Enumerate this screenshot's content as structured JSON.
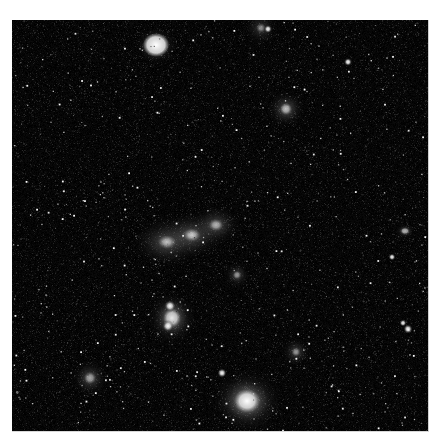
{
  "image": {
    "description": "Deep-sky astronomical image of a galaxy group in grayscale",
    "frame": {
      "x": 12,
      "y": 20,
      "width": 416,
      "height": 411,
      "background": "#030303",
      "page_background": "#ffffff"
    }
  },
  "galaxies": [
    {
      "name": "bright-star-top-left",
      "x": 144,
      "y": 25,
      "core": 9,
      "halo": 22,
      "rx": 1.0,
      "ry": 0.9,
      "brightness": 1.0
    },
    {
      "name": "galaxy-top-right",
      "x": 274,
      "y": 89,
      "core": 3,
      "halo": 20,
      "rx": 1.0,
      "ry": 1.0,
      "brightness": 0.75
    },
    {
      "name": "galaxy-top-edge",
      "x": 249,
      "y": 8,
      "core": 2,
      "halo": 18,
      "rx": 1.0,
      "ry": 1.0,
      "brightness": 0.55
    },
    {
      "name": "galaxy-group-left",
      "x": 155,
      "y": 222,
      "core": 3,
      "halo": 30,
      "rx": 1.2,
      "ry": 0.9,
      "brightness": 0.8
    },
    {
      "name": "galaxy-group-center",
      "x": 180,
      "y": 215,
      "core": 3,
      "halo": 28,
      "rx": 1.2,
      "ry": 0.9,
      "brightness": 0.8
    },
    {
      "name": "galaxy-group-right",
      "x": 204,
      "y": 205,
      "core": 3,
      "halo": 24,
      "rx": 1.1,
      "ry": 0.9,
      "brightness": 0.7
    },
    {
      "name": "galaxy-mid-small",
      "x": 225,
      "y": 255,
      "core": 2,
      "halo": 14,
      "rx": 1.0,
      "ry": 1.0,
      "brightness": 0.6
    },
    {
      "name": "galaxy-pair-lower-left",
      "x": 160,
      "y": 298,
      "core": 5,
      "halo": 26,
      "rx": 1.0,
      "ry": 1.1,
      "brightness": 0.9
    },
    {
      "name": "galaxy-lower-right",
      "x": 284,
      "y": 332,
      "core": 2,
      "halo": 16,
      "rx": 1.0,
      "ry": 1.0,
      "brightness": 0.6
    },
    {
      "name": "galaxy-bottom-left",
      "x": 78,
      "y": 358,
      "core": 3,
      "halo": 20,
      "rx": 1.0,
      "ry": 1.0,
      "brightness": 0.65
    },
    {
      "name": "bright-galaxy-bottom",
      "x": 235,
      "y": 381,
      "core": 7,
      "halo": 34,
      "rx": 1.1,
      "ry": 1.0,
      "brightness": 1.0
    },
    {
      "name": "double-star-right",
      "x": 393,
      "y": 211,
      "core": 2,
      "halo": 8,
      "rx": 1.3,
      "ry": 1.0,
      "brightness": 0.7
    }
  ],
  "stars": {
    "count": 1400,
    "seed": 42,
    "min_brightness": 40,
    "max_brightness": 255
  },
  "notable_stars": [
    {
      "x": 158,
      "y": 286,
      "r": 2.0
    },
    {
      "x": 156,
      "y": 306,
      "r": 2.0
    },
    {
      "x": 210,
      "y": 353,
      "r": 1.6
    },
    {
      "x": 396,
      "y": 309,
      "r": 1.6
    },
    {
      "x": 391,
      "y": 303,
      "r": 1.2
    },
    {
      "x": 336,
      "y": 42,
      "r": 1.4
    },
    {
      "x": 256,
      "y": 9,
      "r": 1.4
    },
    {
      "x": 380,
      "y": 237,
      "r": 1.2
    }
  ]
}
